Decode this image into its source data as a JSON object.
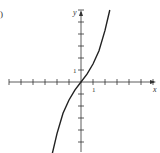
{
  "panel": {
    "label": ")"
  },
  "chart_data": {
    "type": "line",
    "title": "",
    "xlabel": "x",
    "ylabel": "y",
    "tick_labels": {
      "x": [
        "1"
      ],
      "y": [
        "1"
      ]
    },
    "xlim": [
      -6,
      6
    ],
    "ylim": [
      -6,
      6
    ],
    "grid": false,
    "legend": null,
    "series": [
      {
        "name": "curve",
        "description": "increasing odd cubic-like curve through origin",
        "x": [
          -2.4,
          -2,
          -1.5,
          -1,
          -0.5,
          0,
          0.5,
          1,
          1.5,
          2,
          2.4
        ],
        "y": [
          -6.0,
          -4.3,
          -2.6,
          -1.5,
          -0.65,
          0,
          0.65,
          1.5,
          2.6,
          4.3,
          6.0
        ]
      }
    ]
  }
}
